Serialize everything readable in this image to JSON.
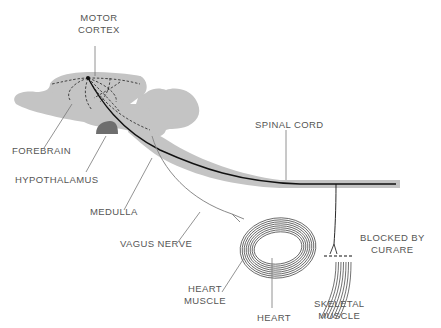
{
  "labels": {
    "motor_cortex": [
      "MOTOR",
      "CORTEX"
    ],
    "forebrain": "FOREBRAIN",
    "hypothalamus": "HYPOTHALAMUS",
    "spinal_cord": "SPINAL CORD",
    "medulla": "MEDULLA",
    "vagus_nerve": "VAGUS NERVE",
    "blocked_by_curare": [
      "BLOCKED BY",
      "CURARE"
    ],
    "heart_muscle": [
      "HEART",
      "MUSCLE"
    ],
    "heart": "HEART",
    "skeletal_muscle": [
      "SKELETAL",
      "MUSCLE"
    ]
  },
  "colors": {
    "tissue": "#c4c4c4",
    "hypothalamus": "#6e6e6e",
    "motor_path": "#111111",
    "vagus_path": "#8a8a8a",
    "leader": "#777777",
    "text": "#555555"
  }
}
